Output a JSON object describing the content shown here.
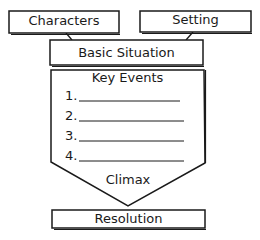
{
  "diagram": {
    "type": "story-map",
    "nodes": {
      "characters": "Characters",
      "setting": "Setting",
      "basic_situation": "Basic Situation",
      "key_events_title": "Key Events",
      "climax": "Climax",
      "resolution": "Resolution"
    },
    "key_events": [
      {
        "number": "1.",
        "value": ""
      },
      {
        "number": "2.",
        "value": ""
      },
      {
        "number": "3.",
        "value": ""
      },
      {
        "number": "4.",
        "value": ""
      }
    ],
    "connections": [
      {
        "from": "Characters",
        "to": "Basic Situation"
      },
      {
        "from": "Setting",
        "to": "Basic Situation"
      },
      {
        "from": "Key Events",
        "to": "Climax"
      },
      {
        "from": "Climax",
        "to": "Resolution"
      }
    ],
    "colors": {
      "stroke": "#1a1a1a",
      "background": "#ffffff"
    }
  }
}
